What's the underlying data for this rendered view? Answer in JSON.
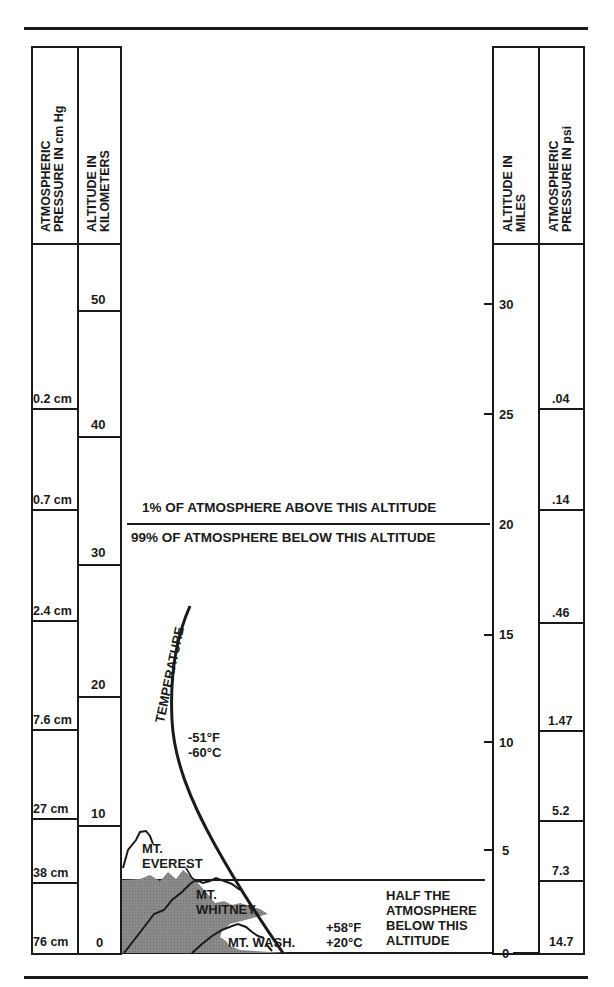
{
  "headers": {
    "left_pressure": [
      "ATMOSPHERIC",
      "PRESSURE IN cm Hg"
    ],
    "left_altitude": [
      "ALTITUDE IN",
      "KILOMETERS"
    ],
    "right_altitude": [
      "ALTITUDE IN",
      "MILES"
    ],
    "right_pressure": [
      "ATMOSPHERIC",
      "PRESSURE IN psi"
    ]
  },
  "pressure_cm_hg": [
    "0.2 cm",
    "0.7 cm",
    "2.4 cm",
    "7.6 cm",
    "27 cm",
    "38 cm",
    "76 cm"
  ],
  "altitude_km": [
    "50",
    "40",
    "30",
    "20",
    "10",
    "0"
  ],
  "altitude_miles": [
    "30",
    "25",
    "20",
    "15",
    "10",
    "5",
    "0"
  ],
  "pressure_psi": [
    ".04",
    ".14",
    ".46",
    "1.47",
    "5.2",
    "7.3",
    "14.7"
  ],
  "annotations": {
    "one_percent": "1% OF ATMOSPHERE ABOVE THIS ALTITUDE",
    "ninety_nine_percent": "99% OF ATMOSPHERE BELOW THIS ALTITUDE",
    "temperature_label": "TEMPERATURE",
    "temp_high_f": "-51°F",
    "temp_high_c": "-60°C",
    "temp_low_f": "+58°F",
    "temp_low_c": "+20°C",
    "half_line1": "HALF THE",
    "half_line2": "ATMOSPHERE",
    "half_line3": "BELOW THIS",
    "half_line4": "ALTITUDE"
  },
  "mountains": {
    "everest": [
      "MT.",
      "EVEREST"
    ],
    "whitney": [
      "MT.",
      "WHITNEY"
    ],
    "washington": "MT. WASH."
  },
  "colors": {
    "ink": "#1a1a1a",
    "mountain_fill": "#8a8a8a",
    "background": "#ffffff"
  }
}
